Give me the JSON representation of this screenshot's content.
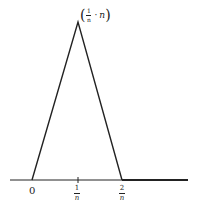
{
  "diagram": {
    "peak_label": {
      "open": "(",
      "num": "1",
      "den": "n",
      "sep": "·",
      "value": "n",
      "close": ")"
    },
    "ticks": [
      {
        "label": "0"
      },
      {
        "num": "1",
        "den": "n"
      },
      {
        "num": "2",
        "den": "n"
      }
    ],
    "colors": {
      "line": "#222222",
      "background": "#ffffff"
    }
  }
}
